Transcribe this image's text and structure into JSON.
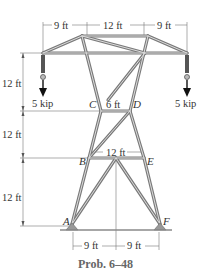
{
  "figure": {
    "caption": "Prob. 6–48",
    "colors": {
      "member": "#7a7a7a",
      "member_core": "#d8d8d8",
      "dim_line": "#555555",
      "text": "#333333",
      "caption": "#666666",
      "ground": "#8a8a8a"
    }
  },
  "dimensions": {
    "top": [
      "9 ft",
      "12 ft",
      "9 ft"
    ],
    "left": [
      "12 ft",
      "12 ft",
      "12 ft"
    ],
    "cd": "6 ft",
    "be": "12 ft",
    "bottom": [
      "9 ft",
      "9 ft"
    ]
  },
  "loads": {
    "left": "5 kip",
    "right": "5 kip"
  },
  "joints": {
    "a": "A",
    "b": "B",
    "c": "C",
    "d": "D",
    "e": "E",
    "f": "F"
  }
}
